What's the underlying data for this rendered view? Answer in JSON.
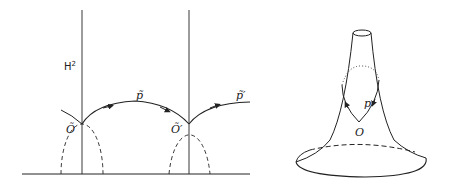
{
  "diagram": {
    "left_panel": {
      "space_label": "H",
      "space_superscript": "2",
      "points": [
        {
          "label": "Õ",
          "name": "O-tilde"
        },
        {
          "label": "Õ′",
          "name": "O-tilde-prime"
        }
      ],
      "path_labels": [
        {
          "label": "p̃",
          "name": "p-tilde"
        },
        {
          "label": "p̃′",
          "name": "p-tilde-prime"
        }
      ]
    },
    "right_panel": {
      "surface": "pseudosphere",
      "point_label": "O",
      "loop_label": "p"
    },
    "colors": {
      "stroke": "#222222",
      "background": "#ffffff"
    }
  }
}
